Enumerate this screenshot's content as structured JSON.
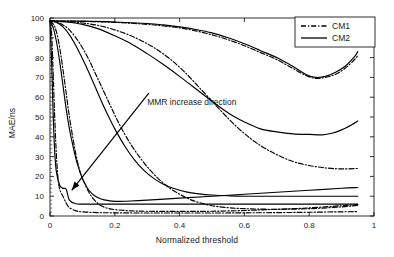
{
  "chart_data": {
    "type": "line",
    "title": "",
    "xlabel": "Normalized threshold",
    "ylabel": "MAE/ns",
    "xlim": [
      0,
      1
    ],
    "ylim": [
      0,
      100
    ],
    "xticks": [
      "0",
      "0.2",
      "0.4",
      "0.6",
      "0.8",
      "1"
    ],
    "xtick_values": [
      0,
      0.2,
      0.4,
      0.6,
      0.8,
      1
    ],
    "yticks": [
      "0",
      "10",
      "20",
      "30",
      "40",
      "50",
      "60",
      "70",
      "80",
      "90",
      "100"
    ],
    "ytick_values": [
      0,
      10,
      20,
      30,
      40,
      50,
      60,
      70,
      80,
      90,
      100
    ],
    "grid": false,
    "legend_position": "top-right",
    "legend": [
      {
        "name": "CM1",
        "style": "dash-dot",
        "color": "#000000"
      },
      {
        "name": "CM2",
        "style": "solid",
        "color": "#000000"
      }
    ],
    "annotations": [
      {
        "text": "MMR increase direction",
        "text_x": 0.3,
        "text_y": 56,
        "arrow_from": [
          0.305,
          62
        ],
        "arrow_to": [
          0.067,
          13
        ]
      }
    ],
    "series": [
      {
        "name": "CM1-1",
        "group": "CM1",
        "style": "dash-dot",
        "x": [
          0.0,
          0.005,
          0.01,
          0.015,
          0.02,
          0.025,
          0.03,
          0.035,
          0.04,
          0.05,
          0.06,
          0.08,
          0.1,
          0.15,
          0.2,
          0.3,
          0.4,
          0.5,
          0.6,
          0.7,
          0.8,
          0.9,
          0.95
        ],
        "y": [
          98.5,
          92.0,
          71.0,
          48.0,
          30.0,
          18.5,
          13.5,
          11.5,
          10.0,
          6.5,
          4.2,
          2.6,
          2.1,
          1.7,
          1.6,
          1.5,
          1.5,
          1.5,
          1.6,
          1.7,
          1.9,
          2.1,
          2.2
        ]
      },
      {
        "name": "CM1-2",
        "group": "CM1",
        "style": "dash-dot",
        "x": [
          0.0,
          0.01,
          0.02,
          0.03,
          0.04,
          0.05,
          0.06,
          0.07,
          0.08,
          0.09,
          0.1,
          0.12,
          0.14,
          0.16,
          0.18,
          0.2,
          0.25,
          0.3,
          0.4,
          0.5,
          0.6,
          0.7,
          0.8,
          0.9,
          0.95
        ],
        "y": [
          98.5,
          97.0,
          93.0,
          85.0,
          74.0,
          62.0,
          50.0,
          40.0,
          31.0,
          24.0,
          19.0,
          12.0,
          7.5,
          5.0,
          3.8,
          3.2,
          2.6,
          2.4,
          2.3,
          2.4,
          2.8,
          3.4,
          4.1,
          5.2,
          5.8
        ]
      },
      {
        "name": "CM1-3",
        "group": "CM1",
        "style": "dash-dot",
        "x": [
          0.0,
          0.02,
          0.04,
          0.06,
          0.08,
          0.1,
          0.12,
          0.14,
          0.16,
          0.18,
          0.2,
          0.22,
          0.25,
          0.28,
          0.31,
          0.34,
          0.37,
          0.4,
          0.43,
          0.46,
          0.5,
          0.55,
          0.6,
          0.7,
          0.8,
          0.9,
          0.95
        ],
        "y": [
          98.5,
          98.0,
          96.5,
          94.0,
          90.0,
          85.0,
          79.0,
          72.0,
          65.0,
          58.0,
          51.0,
          44.5,
          36.0,
          29.0,
          23.0,
          18.0,
          14.0,
          11.0,
          8.5,
          6.8,
          5.2,
          4.2,
          3.7,
          3.4,
          3.7,
          4.6,
          5.4
        ]
      },
      {
        "name": "CM1-4",
        "group": "CM1",
        "style": "dash-dot",
        "x": [
          0.0,
          0.05,
          0.1,
          0.15,
          0.2,
          0.25,
          0.3,
          0.34,
          0.38,
          0.42,
          0.46,
          0.5,
          0.54,
          0.58,
          0.62,
          0.66,
          0.7,
          0.75,
          0.8,
          0.85,
          0.9,
          0.95
        ],
        "y": [
          98.5,
          98.2,
          97.5,
          96.2,
          94.0,
          91.0,
          87.0,
          83.0,
          78.0,
          72.0,
          65.0,
          58.0,
          51.0,
          44.5,
          39.0,
          34.5,
          31.0,
          27.5,
          25.5,
          24.3,
          23.8,
          24.0
        ]
      },
      {
        "name": "CM1-5",
        "group": "CM1",
        "style": "dash-dot",
        "x": [
          0.0,
          0.1,
          0.2,
          0.3,
          0.35,
          0.4,
          0.45,
          0.5,
          0.55,
          0.6,
          0.65,
          0.7,
          0.75,
          0.79,
          0.82,
          0.85,
          0.88,
          0.91,
          0.94,
          0.95
        ],
        "y": [
          98.5,
          98.3,
          97.8,
          96.8,
          96.0,
          95.0,
          93.5,
          91.5,
          89.0,
          86.0,
          82.5,
          79.0,
          74.5,
          71.0,
          69.5,
          70.0,
          71.5,
          74.5,
          79.0,
          81.0
        ]
      },
      {
        "name": "CM2-1",
        "group": "CM2",
        "style": "solid",
        "x": [
          0.0,
          0.005,
          0.01,
          0.015,
          0.02,
          0.03,
          0.04,
          0.05,
          0.06,
          0.08,
          0.1,
          0.15,
          0.2,
          0.3,
          0.4,
          0.5,
          0.6,
          0.7,
          0.8,
          0.9,
          0.95
        ],
        "y": [
          98.5,
          78.0,
          50.0,
          31.0,
          22.0,
          15.5,
          14.0,
          13.5,
          8.0,
          6.2,
          6.0,
          6.0,
          6.0,
          6.0,
          6.0,
          6.0,
          6.0,
          6.0,
          6.0,
          6.0,
          6.0
        ]
      },
      {
        "name": "CM2-2",
        "group": "CM2",
        "style": "solid",
        "x": [
          0.0,
          0.01,
          0.02,
          0.03,
          0.04,
          0.05,
          0.06,
          0.07,
          0.08,
          0.09,
          0.1,
          0.12,
          0.14,
          0.16,
          0.18,
          0.2,
          0.25,
          0.3,
          0.4,
          0.5,
          0.6,
          0.7,
          0.8,
          0.9,
          0.95
        ],
        "y": [
          98.5,
          95.0,
          88.0,
          78.0,
          66.0,
          54.0,
          44.0,
          36.0,
          29.0,
          23.5,
          19.0,
          13.0,
          10.0,
          8.5,
          7.8,
          7.4,
          7.6,
          8.0,
          9.0,
          10.0,
          11.0,
          12.0,
          13.0,
          14.0,
          14.4
        ]
      },
      {
        "name": "CM2-3",
        "group": "CM2",
        "style": "solid",
        "x": [
          0.0,
          0.02,
          0.04,
          0.06,
          0.08,
          0.1,
          0.12,
          0.14,
          0.16,
          0.18,
          0.2,
          0.23,
          0.26,
          0.29,
          0.32,
          0.35,
          0.38,
          0.42,
          0.46,
          0.5,
          0.55,
          0.6,
          0.7,
          0.8,
          0.9,
          0.95
        ],
        "y": [
          98.5,
          97.8,
          95.5,
          91.5,
          86.0,
          79.5,
          72.5,
          65.0,
          57.5,
          50.5,
          44.0,
          35.5,
          28.5,
          23.0,
          19.0,
          16.0,
          14.0,
          12.2,
          11.2,
          10.6,
          10.2,
          10.0,
          10.0,
          10.0,
          10.0,
          10.0
        ]
      },
      {
        "name": "CM2-4",
        "group": "CM2",
        "style": "solid",
        "x": [
          0.0,
          0.05,
          0.1,
          0.15,
          0.2,
          0.25,
          0.3,
          0.35,
          0.4,
          0.44,
          0.48,
          0.52,
          0.56,
          0.6,
          0.65,
          0.7,
          0.75,
          0.8,
          0.84,
          0.87,
          0.9,
          0.93,
          0.95
        ],
        "y": [
          98.5,
          98.0,
          96.8,
          94.5,
          91.0,
          87.0,
          82.0,
          76.5,
          70.5,
          65.5,
          60.5,
          55.5,
          51.0,
          47.5,
          44.0,
          42.5,
          41.5,
          41.2,
          41.0,
          41.8,
          43.5,
          46.0,
          48.0
        ]
      },
      {
        "name": "CM2-5",
        "group": "CM2",
        "style": "solid",
        "x": [
          0.0,
          0.1,
          0.2,
          0.3,
          0.35,
          0.4,
          0.45,
          0.5,
          0.55,
          0.6,
          0.65,
          0.7,
          0.75,
          0.79,
          0.82,
          0.85,
          0.88,
          0.91,
          0.94,
          0.95
        ],
        "y": [
          98.5,
          98.4,
          98.0,
          97.2,
          96.5,
          95.5,
          94.2,
          92.5,
          90.0,
          87.0,
          83.5,
          80.0,
          75.5,
          71.5,
          70.0,
          70.5,
          72.5,
          75.5,
          80.5,
          83.0
        ]
      }
    ]
  }
}
